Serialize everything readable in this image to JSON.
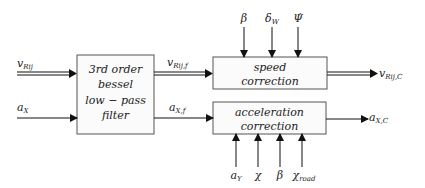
{
  "diagram": {
    "blocks": {
      "filter": {
        "lines": [
          "3rd order",
          "bessel",
          "low − pass",
          "filter"
        ]
      },
      "speed": {
        "lines": [
          "speed",
          "correction"
        ]
      },
      "accel": {
        "lines": [
          "acceleration",
          "correction"
        ]
      }
    },
    "signals": {
      "v_in": {
        "base": "v",
        "sub": "Rij"
      },
      "a_in": {
        "base": "a",
        "sub": "X"
      },
      "v_f": {
        "base": "v",
        "sub": "Rij,f"
      },
      "a_f": {
        "base": "a",
        "sub": "X,f"
      },
      "v_out": {
        "base": "v",
        "sub": "Rij,C"
      },
      "a_out": {
        "base": "a",
        "sub": "X,C"
      }
    },
    "speed_inputs": [
      {
        "base": "β",
        "sub": ""
      },
      {
        "base": "δ",
        "sub": "W"
      },
      {
        "base": "Ψ̇",
        "sub": ""
      }
    ],
    "accel_inputs": [
      {
        "base": "a",
        "sub": "Y"
      },
      {
        "base": "χ",
        "sub": ""
      },
      {
        "base": "β",
        "sub": ""
      },
      {
        "base": "χ",
        "sub": "road"
      }
    ],
    "colors": {
      "line": "#111111",
      "box_border": "#555555",
      "box_fill": "#fbfbfb"
    }
  }
}
